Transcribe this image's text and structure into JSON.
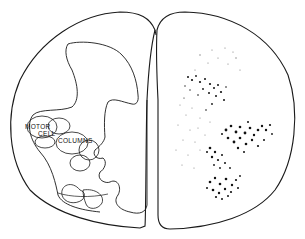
{
  "figure": {
    "type": "spinal-cord-cross-section",
    "labels": {
      "motor": "MOTOR",
      "cell": "CELL",
      "columns": "COLUMNS"
    },
    "colors": {
      "outline": "#1a1a1a",
      "background": "#ffffff",
      "stipple": "#111111"
    }
  }
}
